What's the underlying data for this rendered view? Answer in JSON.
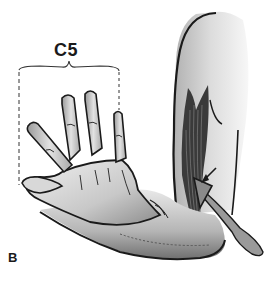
{
  "figure": {
    "dermatome_label": "C5",
    "panel_label": "B",
    "illustration": "biceps-reflex-test",
    "parts": [
      "upper-arm",
      "biceps-muscle",
      "forearm",
      "hand",
      "reflex-hammer",
      "dermatome-bracket"
    ]
  },
  "colors": {
    "ink": "#1a1a1a",
    "skin_light": "#e6e6e6",
    "skin_mid": "#bdbdbd",
    "skin_dark": "#7a7a7a",
    "hammer": "#8a8a8a",
    "background": "#ffffff"
  }
}
